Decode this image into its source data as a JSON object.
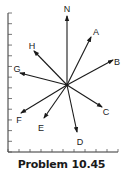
{
  "caption": "Problem 10.45",
  "diagram": {
    "center": [
      67,
      85
    ],
    "axes": {
      "vertical": {
        "x": 8,
        "y_top": 13,
        "y_bottom": 152,
        "tick_count": 14
      },
      "horizontal": {
        "y": 152,
        "x_left": 8,
        "x_right": 118,
        "tick_count": 11
      }
    },
    "vectors": [
      {
        "label": "N",
        "tip": [
          67,
          16
        ],
        "label_pos": [
          67,
          10
        ]
      },
      {
        "label": "A",
        "tip": [
          91,
          37
        ],
        "label_pos": [
          96,
          33
        ]
      },
      {
        "label": "B",
        "tip": [
          113,
          60
        ],
        "label_pos": [
          117,
          63
        ]
      },
      {
        "label": "C",
        "tip": [
          102,
          107
        ],
        "label_pos": [
          106,
          113
        ]
      },
      {
        "label": "D",
        "tip": [
          77,
          132
        ],
        "label_pos": [
          80,
          143
        ]
      },
      {
        "label": "E",
        "tip": [
          44,
          118
        ],
        "label_pos": [
          41,
          129
        ]
      },
      {
        "label": "F",
        "tip": [
          21,
          113
        ],
        "label_pos": [
          19,
          121
        ]
      },
      {
        "label": "G",
        "tip": [
          20,
          73
        ],
        "label_pos": [
          17,
          70
        ]
      },
      {
        "label": "H",
        "tip": [
          34,
          51
        ],
        "label_pos": [
          32,
          47
        ]
      }
    ]
  }
}
